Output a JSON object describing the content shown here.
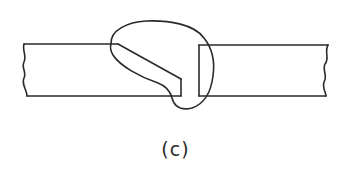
{
  "figure": {
    "caption": "(c)",
    "stroke_color": "#2a2a2a",
    "background_color": "#ffffff"
  },
  "parts": [
    {
      "name": "left-plate",
      "edge": "single-bevel",
      "break_line": "left"
    },
    {
      "name": "right-plate",
      "edge": "square",
      "break_line": "right"
    },
    {
      "name": "weld-bead",
      "shape": "fusion-zone-outline"
    }
  ]
}
